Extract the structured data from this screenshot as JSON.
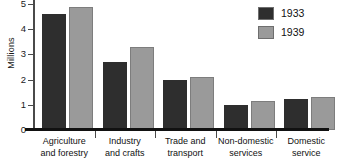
{
  "chart_data": {
    "type": "bar",
    "title": "",
    "xlabel": "",
    "ylabel": "Millions",
    "ylim": [
      0,
      5
    ],
    "yticks": [
      "0",
      "1",
      "2",
      "3",
      "4",
      "5"
    ],
    "grid": false,
    "legend_position": "top-right",
    "categories": [
      "Agriculture and forestry",
      "Industry and crafts",
      "Trade and transport",
      "Non-domestic services",
      "Domestic service"
    ],
    "category_lines": [
      [
        "Agriculture",
        "and forestry"
      ],
      [
        "Industry",
        "and crafts"
      ],
      [
        "Trade and",
        "transport"
      ],
      [
        "Non-domestic",
        "services"
      ],
      [
        "Domestic",
        "service"
      ]
    ],
    "series": [
      {
        "name": "1933",
        "color": "#2e2e2e",
        "values": [
          4.6,
          2.7,
          2.0,
          1.0,
          1.25
        ]
      },
      {
        "name": "1939",
        "color": "#9a9a9a",
        "values": [
          4.9,
          3.3,
          2.1,
          1.15,
          1.3
        ]
      }
    ]
  },
  "legend": {
    "items": [
      {
        "label": "1933",
        "color": "#2e2e2e"
      },
      {
        "label": "1939",
        "color": "#9a9a9a"
      }
    ]
  }
}
